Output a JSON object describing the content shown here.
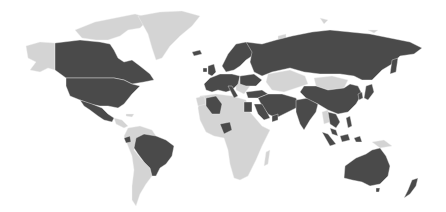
{
  "map": {
    "type": "choropleth-world",
    "legend": null,
    "colors": {
      "background": "#ffffff",
      "highlighted": "#4a4a4a",
      "not_highlighted": "#d4d4d4"
    },
    "highlighted_regions": [
      "Canada",
      "United States",
      "Mexico",
      "Brazil",
      "Ecuador",
      "Norway",
      "Sweden",
      "Finland",
      "United Kingdom",
      "Ireland",
      "France",
      "Spain",
      "Portugal",
      "Germany",
      "Italy",
      "Poland",
      "Netherlands",
      "Belgium",
      "Switzerland",
      "Austria",
      "Romania",
      "Ukraine",
      "Russia",
      "Turkey",
      "Iceland",
      "Algeria",
      "Egypt",
      "Nigeria",
      "Saudi Arabia",
      "Iran",
      "Iraq",
      "Oman",
      "Afghanistan",
      "Pakistan",
      "India",
      "Bangladesh",
      "China",
      "Japan",
      "South Korea",
      "Vietnam",
      "Thailand",
      "Malaysia",
      "Philippines",
      "Indonesia",
      "Australia",
      "New Zealand"
    ],
    "not_highlighted_regions": [
      "Alaska",
      "Greenland",
      "Canadian Arctic Archipelago",
      "Central America",
      "Caribbean",
      "Colombia",
      "Venezuela",
      "Peru",
      "Bolivia",
      "Argentina",
      "Chile",
      "Paraguay",
      "Uruguay",
      "Morocco",
      "Libya",
      "Sub-Saharan Africa",
      "Madagascar",
      "Kazakhstan",
      "Mongolia",
      "Turkmenistan",
      "Uzbekistan",
      "Myanmar",
      "Papua New Guinea",
      "Balkans",
      "Belarus"
    ]
  }
}
